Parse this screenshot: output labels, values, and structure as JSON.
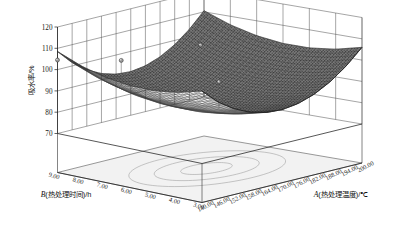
{
  "figure": {
    "kind": "3d-surface-plot",
    "background_color": "#ffffff",
    "surface_color": "#6e6e6e",
    "mesh_color": "#3a3a3a",
    "grid_color": "#4d4d4d",
    "floor_color": "#f0f0f0",
    "contour_color": "#8c8c8c"
  },
  "chart_data": {
    "type": "surface",
    "title": "",
    "subtitle": "",
    "zlabel": "吸水率/%",
    "xlabel": "A(热处理温度)/℃",
    "ylabel": "B(热处理时间)/h",
    "xlabel_letter": "A",
    "xlabel_rest": "(热处理温度)/℃",
    "ylabel_letter": "B",
    "ylabel_rest": "(热处理时间)/h",
    "grid": true,
    "legend": "none",
    "zlim": [
      70,
      120
    ],
    "xlim": [
      140,
      200
    ],
    "ylim": [
      3,
      9
    ],
    "z_ticks": [
      "120",
      "110",
      "100",
      "90",
      "80",
      "70"
    ],
    "z_tick_values": [
      120,
      110,
      100,
      90,
      80,
      70
    ],
    "x_ticks": [
      "140.00",
      "146.00",
      "152.00",
      "158.00",
      "164.00",
      "170.00",
      "176.00",
      "182.00",
      "188.00",
      "194.00",
      "200.00"
    ],
    "x_tick_values": [
      140,
      146,
      152,
      158,
      164,
      170,
      176,
      182,
      188,
      194,
      200
    ],
    "y_ticks": [
      "9.00",
      "8.00",
      "7.00",
      "6.00",
      "5.00",
      "4.00",
      "3.00"
    ],
    "y_tick_values": [
      9,
      8,
      7,
      6,
      5,
      4,
      3
    ],
    "x": [
      140,
      146,
      152,
      158,
      164,
      170,
      176,
      182,
      188,
      194,
      200
    ],
    "y": [
      3,
      4,
      5,
      6,
      7,
      8,
      9
    ],
    "z": [
      [
        104.0,
        97.0,
        92.0,
        88.5,
        86.5,
        86.0,
        87.0,
        89.5,
        93.5,
        99.0,
        106.0
      ],
      [
        101.0,
        94.0,
        89.0,
        85.5,
        83.5,
        83.0,
        84.0,
        86.5,
        90.5,
        96.0,
        103.0
      ],
      [
        99.5,
        92.5,
        87.5,
        84.0,
        82.0,
        81.5,
        82.5,
        85.0,
        89.0,
        94.5,
        101.5
      ],
      [
        99.5,
        92.5,
        87.5,
        84.0,
        82.0,
        81.5,
        82.5,
        85.0,
        89.0,
        94.5,
        101.5
      ],
      [
        101.0,
        94.0,
        89.0,
        85.5,
        83.5,
        83.0,
        84.0,
        86.5,
        90.5,
        96.0,
        103.0
      ],
      [
        104.0,
        97.0,
        92.0,
        88.5,
        86.5,
        86.0,
        87.0,
        89.5,
        93.5,
        99.0,
        106.0
      ],
      [
        108.5,
        101.5,
        96.5,
        93.0,
        91.0,
        90.5,
        91.5,
        94.0,
        98.0,
        103.5,
        110.5
      ]
    ],
    "surface_shape": "saddle",
    "minimum_region": {
      "x": 170,
      "y": 5.5,
      "z": 81.5
    },
    "data_points": [
      {
        "x": 140,
        "y": 9.0,
        "z": 104.5
      },
      {
        "x": 158,
        "y": 8.2,
        "z": 101.0
      },
      {
        "x": 188,
        "y": 8.0,
        "z": 100.0
      },
      {
        "x": 170,
        "y": 5.5,
        "z": 93.5
      }
    ],
    "floor_contours": [
      {
        "level": 90,
        "cx": 0.5,
        "cy": 0.5,
        "rx": 0.41,
        "ry": 0.31
      },
      {
        "level": 85,
        "cx": 0.5,
        "cy": 0.5,
        "rx": 0.28,
        "ry": 0.2
      },
      {
        "level": 82,
        "cx": 0.5,
        "cy": 0.5,
        "rx": 0.14,
        "ry": 0.095
      }
    ]
  }
}
